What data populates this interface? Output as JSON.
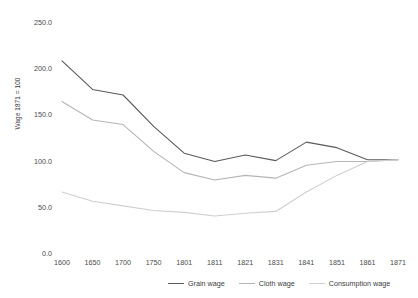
{
  "chart_data": {
    "type": "line",
    "title": "",
    "xlabel": "",
    "ylabel": "Wage 1871 = 100",
    "ylim": [
      0,
      250
    ],
    "yticks": [
      0,
      50,
      100,
      150,
      200,
      250
    ],
    "ytick_labels": [
      "0.0",
      "50.0",
      "100.0",
      "150.0",
      "200.0",
      "250.0"
    ],
    "categories": [
      "1600",
      "1650",
      "1700",
      "1750",
      "1801",
      "1811",
      "1821",
      "1831",
      "1841",
      "1851",
      "1861",
      "1871"
    ],
    "grid": false,
    "legend_position": "bottom",
    "series": [
      {
        "name": "Grain wage",
        "color": "#5a5a5a",
        "values": [
          208,
          177,
          171,
          137,
          108,
          99,
          106,
          100,
          120,
          114,
          101,
          101
        ]
      },
      {
        "name": "Cloth wage",
        "color": "#b5b5b5",
        "values": [
          164,
          144,
          139,
          110,
          87,
          79,
          84,
          81,
          95,
          99,
          99,
          101
        ]
      },
      {
        "name": "Consumption wage",
        "color": "#cfcfcf",
        "values": [
          66,
          56,
          51,
          46,
          44,
          40,
          43,
          45,
          66,
          84,
          99,
          101
        ]
      }
    ]
  },
  "legend": {
    "items": [
      {
        "label": "Grain wage",
        "color": "#5a5a5a"
      },
      {
        "label": "Cloth wage",
        "color": "#b5b5b5"
      },
      {
        "label": "Consumption wage",
        "color": "#cfcfcf"
      }
    ]
  }
}
